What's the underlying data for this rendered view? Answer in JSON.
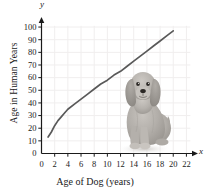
{
  "chart_data": {
    "type": "line",
    "title": "",
    "subtitle": "",
    "xlabel": "Age of Dog (years)",
    "ylabel": "Age in Human Years",
    "x_axis_variable": "x",
    "y_axis_variable": "y",
    "xlim": [
      0,
      23
    ],
    "ylim": [
      0,
      104
    ],
    "xticks": [
      0,
      2,
      4,
      6,
      8,
      10,
      12,
      14,
      16,
      18,
      20,
      22
    ],
    "yticks": [
      0,
      10,
      20,
      30,
      40,
      50,
      60,
      70,
      80,
      90,
      100
    ],
    "xtick_labels": [
      "0",
      "2",
      "4",
      "6",
      "8",
      "10",
      "12",
      "14",
      "16",
      "18",
      "20",
      "22"
    ],
    "ytick_labels": [
      "0",
      "10",
      "20",
      "30",
      "40",
      "50",
      "60",
      "70",
      "80",
      "90",
      "100"
    ],
    "grid": true,
    "grid_color": "#f0eeee",
    "legend": "none",
    "curve_color": "#595959",
    "axis_color": "#1a1a1a",
    "series": [
      {
        "name": "Dog age to human age",
        "x": [
          1,
          1.5,
          2,
          2.5,
          3,
          3.5,
          4,
          5,
          6,
          7,
          8,
          9,
          10,
          11,
          12,
          13,
          14,
          15,
          16,
          17,
          18,
          19,
          20
        ],
        "values": [
          13,
          17,
          22,
          26,
          29,
          32,
          35,
          39,
          43,
          47,
          51,
          55,
          58,
          62,
          65,
          69,
          73,
          77,
          81,
          85,
          89,
          93,
          97
        ]
      }
    ],
    "annotations": [
      {
        "name": "dog-photo",
        "description": "grayscale photograph of a sitting dog",
        "x_range": [
          12,
          19
        ],
        "y_range": [
          5,
          62
        ]
      }
    ]
  },
  "figure": {
    "background": "#ffffff",
    "dog_image_alt": "sitting dog"
  }
}
